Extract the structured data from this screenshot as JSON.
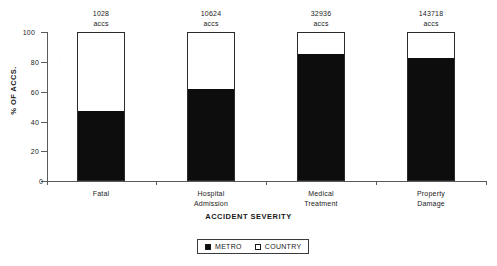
{
  "chart_data": {
    "type": "bar",
    "subtype": "stacked-100-percent",
    "title": "",
    "xlabel": "ACCIDENT SEVERITY",
    "ylabel": "% OF ACCS.",
    "ylim": [
      0,
      100
    ],
    "yticks": [
      0,
      20,
      40,
      60,
      80,
      100
    ],
    "ytick_labels": [
      "0",
      "20",
      "40",
      "60",
      "80",
      "100"
    ],
    "grid": false,
    "legend_position": "bottom-center",
    "categories": [
      "Fatal",
      "Hospital Admission",
      "Medical Treatment",
      "Property Damage"
    ],
    "category_lines": [
      [
        "Fatal"
      ],
      [
        "Hospital",
        "Admission"
      ],
      [
        "Medical",
        "Treatment"
      ],
      [
        "Property",
        "Damage"
      ]
    ],
    "series": [
      {
        "name": "METRO",
        "color": "#0d0d0d",
        "values": [
          47,
          62,
          86,
          83
        ]
      },
      {
        "name": "COUNTRY",
        "color": "#ffffff",
        "values": [
          53,
          38,
          14,
          17
        ]
      }
    ],
    "bar_annotations": [
      {
        "value": "1028",
        "unit": "accs"
      },
      {
        "value": "10624",
        "unit": "accs"
      },
      {
        "value": "32936",
        "unit": "accs"
      },
      {
        "value": "143718",
        "unit": "accs"
      }
    ],
    "annotation_unit": "accs"
  },
  "legend": {
    "items": [
      {
        "label": "METRO",
        "swatch": "filled-square-icon"
      },
      {
        "label": "COUNTRY",
        "swatch": "hollow-square-icon"
      }
    ]
  }
}
